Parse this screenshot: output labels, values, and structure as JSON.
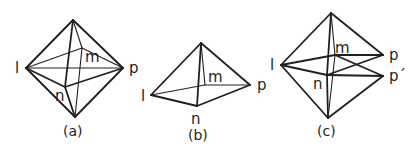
{
  "figures": [
    {
      "id": "a",
      "caption": "(a)",
      "shape": "octahedron",
      "labels": {
        "l": "l",
        "m": "m",
        "n": "n",
        "p": "p"
      },
      "vertices": {
        "top": [
          73,
          20
        ],
        "bottom": [
          75,
          117
        ],
        "l": [
          26,
          68
        ],
        "p": [
          123,
          68
        ],
        "m": [
          82,
          48
        ],
        "n": [
          65,
          87
        ]
      }
    },
    {
      "id": "b",
      "caption": "(b)",
      "shape": "square pyramid",
      "labels": {
        "l": "l",
        "m": "m",
        "n": "n",
        "p": "p"
      },
      "vertices": {
        "top": [
          201,
          43
        ],
        "l": [
          151,
          95
        ],
        "p": [
          250,
          85
        ],
        "m": [
          205,
          85
        ],
        "n": [
          197,
          106
        ]
      }
    },
    {
      "id": "c",
      "caption": "(c)",
      "shape": "distorted octahedron",
      "labels": {
        "l": "l",
        "m": "m",
        "n": "n",
        "p": "p",
        "p_prime": "p´"
      },
      "vertices": {
        "top": [
          331,
          13
        ],
        "bottom": [
          328,
          118
        ],
        "l": [
          281,
          65
        ],
        "p": [
          383,
          55
        ],
        "p_prime": [
          383,
          76
        ],
        "m": [
          335,
          55
        ],
        "n": [
          327,
          75
        ]
      }
    }
  ]
}
